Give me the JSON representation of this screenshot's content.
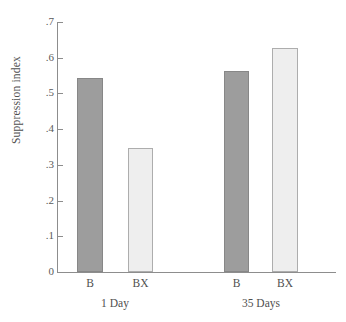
{
  "chart_data": {
    "type": "bar",
    "title": "",
    "subtitle": "",
    "xlabel": "",
    "ylabel": "Suppression index",
    "ylim": [
      0,
      0.7
    ],
    "grid": false,
    "legend_position": "none",
    "y_ticks": [
      "0",
      ".1",
      ".2",
      ".3",
      ".4",
      ".5",
      ".6",
      ".7"
    ],
    "y_tick_values": [
      0,
      0.1,
      0.2,
      0.3,
      0.4,
      0.5,
      0.6,
      0.7
    ],
    "categories": [
      "B",
      "BX",
      "B",
      "BX"
    ],
    "groups": [
      {
        "label": "1 Day",
        "bars": [
          {
            "category": "B",
            "value": 0.543,
            "fill": "dark"
          },
          {
            "category": "BX",
            "value": 0.347,
            "fill": "light"
          }
        ]
      },
      {
        "label": "35 Days",
        "bars": [
          {
            "category": "B",
            "value": 0.564,
            "fill": "dark"
          },
          {
            "category": "BX",
            "value": 0.628,
            "fill": "light"
          }
        ]
      }
    ],
    "values": [
      0.543,
      0.347,
      0.564,
      0.628
    ],
    "colors": {
      "dark_bar": "#9d9d9d",
      "light_bar": "#eeeeee",
      "axis": "#8d8d8d",
      "text": "#4f4f4f",
      "background": "#ffffff"
    }
  }
}
